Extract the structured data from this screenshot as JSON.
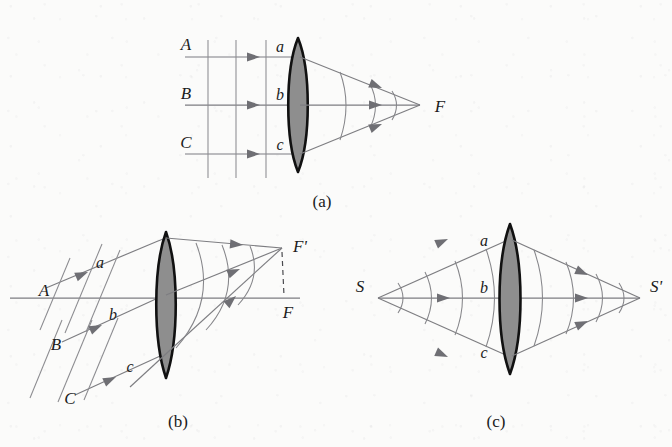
{
  "figure": {
    "background_color": "#fbfbfa",
    "ink_color": "#7d7d81",
    "lens_fill_color": "#8e8e8e",
    "lens_outline_color": "#111111"
  },
  "panels": [
    {
      "id": "a",
      "caption": "(a)",
      "description": "Parallel rays on axis converge to focal point F",
      "incoming_ray_labels": [
        "A",
        "B",
        "C"
      ],
      "lens_point_labels": [
        "a",
        "b",
        "c"
      ],
      "focus_labels": [
        "F"
      ],
      "incoming_wavefront_count": 3,
      "outgoing_wavefront_count": 3,
      "ray_count": 3
    },
    {
      "id": "b",
      "caption": "(b)",
      "description": "Oblique parallel rays converge to off-axis focal point F prime",
      "incoming_ray_labels": [
        "A",
        "B",
        "C"
      ],
      "lens_point_labels": [
        "a",
        "b",
        "c"
      ],
      "focus_labels": [
        "F'",
        "F"
      ],
      "incoming_wavefront_count": 3,
      "outgoing_wavefront_count": 3,
      "ray_count": 3
    },
    {
      "id": "c",
      "caption": "(c)",
      "description": "Point source S imaged to point S prime through the lens",
      "source_label": "S",
      "image_label": "S'",
      "lens_point_labels": [
        "a",
        "b",
        "c"
      ],
      "incoming_wavefront_count": 4,
      "outgoing_wavefront_count": 4,
      "ray_count": 3
    }
  ],
  "labels": {
    "panel_a": {
      "A": "A",
      "B": "B",
      "C": "C",
      "a": "a",
      "b": "b",
      "c": "c",
      "F": "F",
      "caption": "(a)"
    },
    "panel_b": {
      "A": "A",
      "B": "B",
      "C": "C",
      "a": "a",
      "b": "b",
      "c": "c",
      "F_prime": "F'",
      "F": "F",
      "caption": "(b)"
    },
    "panel_c": {
      "S": "S",
      "S_prime": "S'",
      "a": "a",
      "b": "b",
      "c": "c",
      "caption": "(c)"
    }
  }
}
